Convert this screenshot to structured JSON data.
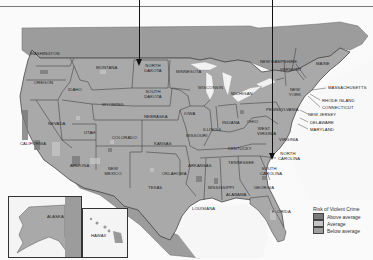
{
  "map": {
    "subject": "Risk of Violent Crime by county, United States",
    "background_color": "#f8f8f8",
    "land_color": "#a9a9a9",
    "water_color": "#f4f4f4",
    "states": {
      "washington": "WASHINGTON",
      "oregon": "OREGON",
      "california": "CALIFORNIA",
      "idaho": "IDAHO",
      "nevada": "NEVADA",
      "montana": "MONTANA",
      "wyoming": "WYOMING",
      "utah": "UTAH",
      "arizona": "ARIZONA",
      "colorado": "COLORADO",
      "new_mexico": "NEW MEXICO",
      "north_dakota": "NORTH DAKOTA",
      "south_dakota": "SOUTH DAKOTA",
      "nebraska": "NEBRASKA",
      "kansas": "KANSAS",
      "oklahoma": "OKLAHOMA",
      "texas": "TEXAS",
      "minnesota": "MINNESOTA",
      "iowa": "IOWA",
      "missouri": "MISSOURI",
      "arkansas": "ARKANSAS",
      "louisiana": "LOUISIANA",
      "wisconsin": "WISCONSIN",
      "illinois": "ILLINOIS",
      "michigan": "MICHIGAN",
      "indiana": "INDIANA",
      "ohio": "OHIO",
      "kentucky": "KENTUCKY",
      "tennessee": "TENNESSEE",
      "mississippi": "MISSISSIPPI",
      "alabama": "ALABAMA",
      "georgia": "GEORGIA",
      "florida": "FLORIDA",
      "south_carolina": "SOUTH CAROLINA",
      "north_carolina": "NORTH CAROLINA",
      "virginia": "VIRGINIA",
      "west_virginia": "WEST VIRGINIA",
      "pennsylvania": "PENNSYLVANIA",
      "new_york": "NEW YORK",
      "vermont": "VERMONT",
      "new_hampshire": "NEW HAMPSHIRE",
      "maine": "MAINE",
      "massachusetts": "MASSACHUSETTS",
      "rhode_island": "RHODE ISLAND",
      "connecticut": "CONNECTICUT",
      "new_jersey": "NEW JERSEY",
      "delaware": "DELAWARE",
      "maryland": "MARYLAND",
      "alaska": "ALASKA",
      "hawaii": "HAWAII"
    },
    "pointers": [
      {
        "target": "North Dakota",
        "x": 139
      },
      {
        "target": "North Carolina",
        "x": 272
      }
    ]
  },
  "legend": {
    "title": "Risk of Violent Crime",
    "items": [
      {
        "label": "Above average",
        "color": "#7a7a7a"
      },
      {
        "label": "Average",
        "color": "#c4c4c4"
      },
      {
        "label": "Below average",
        "color": "#a0a0a0"
      }
    ]
  }
}
